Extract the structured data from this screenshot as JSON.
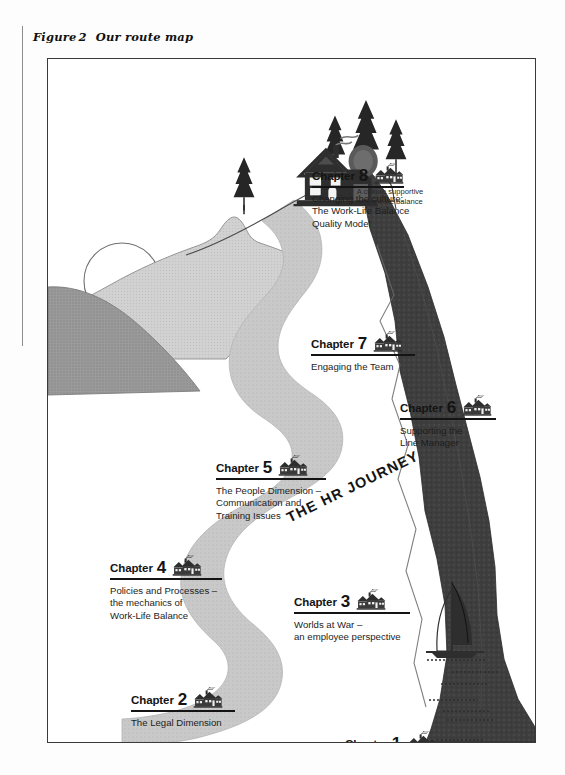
{
  "figure": {
    "label": "Figure",
    "number": "2",
    "title": "Our route map"
  },
  "colors": {
    "road": "#c9c9c9",
    "hill_light": "#cfcfcf",
    "hill_dark": "#9a9a9a",
    "cliff": "#3e3e3e",
    "ink": "#141414",
    "frame": "#3a3a3a",
    "page": "#ffffff"
  },
  "artwork": {
    "road_label": "THE  HR  JOURNEY",
    "summit_caption": "A culture supportive\nof work-life balance",
    "icons": {
      "house": "house-icon",
      "tree": "conifer-tree-icon",
      "sailboat": "sailboat-icon",
      "sun": "sun-icon",
      "hill": "hill-icon",
      "cliff": "cliff-icon",
      "water": "water-lines-icon",
      "road": "winding-road-icon"
    }
  },
  "chapters": [
    {
      "word": "Chapter",
      "number": "1",
      "desc": "The Business Case for\nWork-Life Balance",
      "rule_width": 92,
      "x": 297,
      "y": 672
    },
    {
      "word": "Chapter",
      "number": "2",
      "desc": "The Legal Dimension",
      "rule_width": 104,
      "x": 83,
      "y": 628
    },
    {
      "word": "Chapter",
      "number": "3",
      "desc": "Worlds at War –\nan employee perspective",
      "rule_width": 116,
      "x": 246,
      "y": 530
    },
    {
      "word": "Chapter",
      "number": "4",
      "desc": "Policies and Processes –\nthe mechanics of\nWork-Life Balance",
      "rule_width": 112,
      "x": 62,
      "y": 496
    },
    {
      "word": "Chapter",
      "number": "5",
      "desc": "The People Dimension –\nCommunication and\nTraining Issues",
      "rule_width": 110,
      "x": 168,
      "y": 396
    },
    {
      "word": "Chapter",
      "number": "6",
      "desc": "Supporting the\nLine Manager",
      "rule_width": 96,
      "x": 352,
      "y": 336
    },
    {
      "word": "Chapter",
      "number": "7",
      "desc": "Engaging the Team",
      "rule_width": 104,
      "x": 263,
      "y": 272
    },
    {
      "word": "Chapter",
      "number": "8",
      "desc": "Changing the culture:\nThe Work-Life Balance\nQuality Model",
      "rule_width": 92,
      "x": 264,
      "y": 104
    }
  ]
}
